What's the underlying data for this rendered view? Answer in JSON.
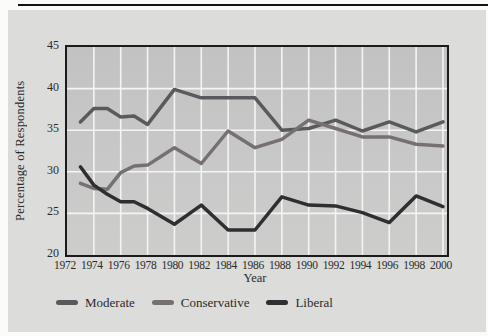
{
  "figure": {
    "card_color": "#dcdcdb",
    "top_rule_color": "#141414",
    "text_color": "#2b2b28"
  },
  "chart_data": {
    "type": "line",
    "title": "",
    "xlabel": "Year",
    "ylabel": "Percentage of Respondents",
    "xlim": [
      1972,
      2000.3
    ],
    "ylim": [
      20,
      45
    ],
    "x_ticks": [
      1972,
      1974,
      1976,
      1978,
      1980,
      1982,
      1984,
      1986,
      1988,
      1990,
      1992,
      1994,
      1996,
      1998,
      2000
    ],
    "y_ticks": [
      20,
      25,
      30,
      35,
      40,
      45
    ],
    "grid": true,
    "grid_color": "#f4f4f2",
    "plot_border_color": "#1b1b1b",
    "plot_bg_top": "#c2c2c3",
    "plot_bg_bottom": "#cdcdcc",
    "x": [
      1973,
      1974,
      1975,
      1976,
      1977,
      1978,
      1980,
      1982,
      1984,
      1986,
      1988,
      1990,
      1992,
      1994,
      1996,
      1998,
      2000
    ],
    "series": [
      {
        "name": "Moderate",
        "color": "#5a5a5e",
        "values": [
          36.0,
          37.6,
          37.6,
          36.6,
          36.7,
          35.7,
          39.9,
          38.9,
          38.9,
          38.9,
          35.0,
          35.2,
          36.2,
          34.9,
          36.0,
          34.8,
          36.0
        ]
      },
      {
        "name": "Conservative",
        "color": "#767170",
        "values": [
          28.6,
          28.0,
          27.9,
          29.9,
          30.7,
          30.8,
          32.9,
          31.0,
          34.9,
          32.9,
          33.9,
          36.2,
          35.2,
          34.2,
          34.2,
          33.3,
          33.1
        ]
      },
      {
        "name": "Liberal",
        "color": "#2f2f32",
        "values": [
          30.6,
          28.4,
          27.3,
          26.4,
          26.4,
          25.6,
          23.7,
          26.0,
          23.0,
          23.0,
          27.0,
          26.0,
          25.9,
          25.1,
          23.9,
          27.1,
          25.8
        ]
      }
    ],
    "legend_position": "bottom"
  }
}
